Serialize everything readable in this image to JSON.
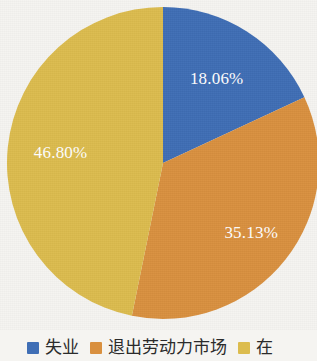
{
  "chart_data": {
    "type": "pie",
    "title": "",
    "categories": [
      "失业",
      "退出劳动力市场",
      "在业"
    ],
    "values": [
      18.06,
      35.13,
      46.8
    ],
    "value_labels": [
      "18.06%",
      "35.13%",
      "46.80%"
    ],
    "colors": [
      "#3f6eb5",
      "#d9903f",
      "#dcbc4e"
    ],
    "start_angle_deg": 0,
    "direction": "clockwise",
    "legend_position": "bottom",
    "grid": false,
    "xlabel": "",
    "ylabel": ""
  },
  "legend": {
    "items": [
      {
        "label": "失业",
        "color": "#3f6eb5"
      },
      {
        "label": "退出劳动力市场",
        "color": "#d9903f"
      },
      {
        "label": "在",
        "color": "#dcbc4e"
      }
    ]
  },
  "labels": {
    "blue": "18.06%",
    "orange": "35.13%",
    "yellow": "46.80%"
  },
  "colors": {
    "background": "#f5f4f1",
    "slice_blue": "#3f6eb5",
    "slice_orange": "#d9903f",
    "slice_yellow": "#dcbc4e",
    "label_text": "#ffffff",
    "legend_text": "#2b2b2b"
  }
}
